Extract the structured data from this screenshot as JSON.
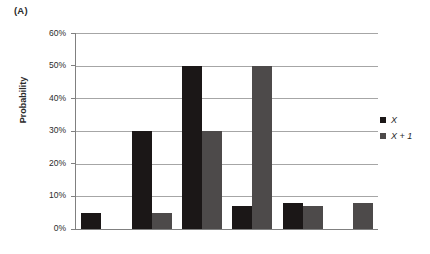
{
  "panel": {
    "label": "(A)"
  },
  "legend": {
    "position": "right",
    "entries": [
      {
        "label": "X",
        "color": "#1b1717",
        "swatch_name": "legend-swatch-x"
      },
      {
        "label": "X + 1",
        "color": "#4d4a4a",
        "swatch_name": "legend-swatch-x-plus-1"
      }
    ]
  },
  "axes": {
    "y_title": "Probability",
    "y_ticks": [
      "60%",
      "50%",
      "40%",
      "30%",
      "20%",
      "10%",
      "0%"
    ],
    "x_ticks": [
      "",
      "",
      "",
      "",
      "",
      ""
    ]
  },
  "chart_data": {
    "type": "bar",
    "title": "",
    "subtitle": "",
    "xlabel": "",
    "ylabel": "Probability",
    "ylim": [
      0,
      60
    ],
    "y_tick_values": [
      0,
      10,
      20,
      30,
      40,
      50,
      60
    ],
    "y_tick_labels": [
      "0%",
      "10%",
      "20%",
      "30%",
      "40%",
      "50%",
      "60%"
    ],
    "grid": true,
    "grid_axis": "y",
    "legend_position": "right",
    "categories": [
      "1",
      "2",
      "3",
      "4",
      "5",
      "6"
    ],
    "series": [
      {
        "name": "X",
        "color": "#1b1717",
        "values": [
          5,
          30,
          50,
          7,
          8,
          0
        ]
      },
      {
        "name": "X + 1",
        "color": "#4d4a4a",
        "values": [
          0,
          5,
          30,
          50,
          7,
          8
        ]
      }
    ],
    "value_unit": "percent",
    "annotations": [
      {
        "text": "(A)",
        "position": "top-left"
      }
    ]
  }
}
